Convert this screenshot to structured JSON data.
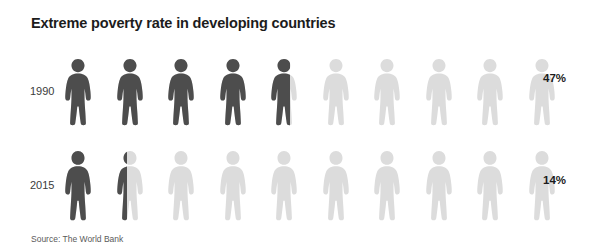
{
  "title": "Extreme poverty rate in developing countries",
  "source": "Source: The World Bank",
  "colors": {
    "background": "#ffffff",
    "filled": "#4d4d4d",
    "empty": "#dcdcdc",
    "title": "#1c1c1c",
    "label": "#3b3b3b"
  },
  "chart_data": {
    "type": "pictogram",
    "title": "Extreme poverty rate in developing countries",
    "xlabel": "",
    "ylabel": "",
    "unit": "%",
    "icon": "person-icon",
    "icons_per_row": 10,
    "value_per_icon": 10,
    "categories": [
      "1990",
      "2015"
    ],
    "values": [
      47,
      14
    ],
    "value_labels": [
      "47%",
      "14%"
    ],
    "series": [
      {
        "name": "Extreme poverty rate",
        "values": [
          47,
          14
        ]
      }
    ],
    "rows": [
      {
        "label": "1990",
        "value": 47,
        "value_label": "47%",
        "full_icons": 4,
        "partial_icon_fraction": 0.7
      },
      {
        "label": "2015",
        "value": 14,
        "value_label": "14%",
        "full_icons": 1,
        "partial_icon_fraction": 0.42
      }
    ],
    "source": "Source: The World Bank",
    "legend": [],
    "grid": false
  }
}
